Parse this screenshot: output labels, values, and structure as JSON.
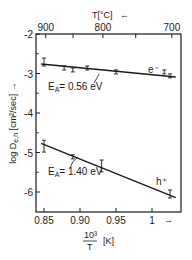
{
  "chart_data": {
    "type": "scatter",
    "title": "",
    "xlabel_numerator": "10³",
    "xlabel_denominator": "T",
    "xlabel_unit": "[K]",
    "xlabel_arrow": "→",
    "ylabel": "log D",
    "ylabel_sub": "e,h",
    "ylabel_unit": "[cm²/sec]",
    "ylabel_arrow": "→",
    "top_axis_label": "T[°C]",
    "top_axis_arrow": "←",
    "xlim": [
      0.84,
      1.04
    ],
    "ylim": [
      -6.5,
      -2
    ],
    "x_ticks": [
      0.85,
      0.9,
      0.95,
      1.0
    ],
    "x_tick_labels": [
      "0.85",
      "0.90",
      "0.95",
      "1"
    ],
    "y_ticks": [
      -2,
      -3,
      -4,
      -5,
      -6
    ],
    "y_tick_labels": [
      "-2",
      "-3",
      "-4",
      "-5",
      "-6"
    ],
    "top_ticks_celsius": [
      900,
      850,
      800,
      750,
      700
    ],
    "top_tick_labels": [
      "900",
      "",
      "800",
      "",
      "700"
    ],
    "grid": false,
    "series": [
      {
        "name": "e⁻",
        "label": "e⁻",
        "activation_energy": "E_A = 0.56 eV",
        "fit_line": [
          [
            0.846,
            -2.76
          ],
          [
            1.033,
            -3.09
          ]
        ],
        "points": [
          {
            "x": 0.85,
            "y": -2.71,
            "err": 0.1
          },
          {
            "x": 0.878,
            "y": -2.86,
            "err": 0.05
          },
          {
            "x": 0.89,
            "y": -2.91,
            "err": 0.03
          },
          {
            "x": 0.91,
            "y": -2.86,
            "err": 0.05
          },
          {
            "x": 0.95,
            "y": -2.96,
            "err": 0.05
          },
          {
            "x": 1.017,
            "y": -2.96,
            "err": 0.05
          },
          {
            "x": 1.025,
            "y": -3.06,
            "err": 0.03
          }
        ]
      },
      {
        "name": "h⁺",
        "label": "h⁺",
        "activation_energy": "E_A = 1.40 eV",
        "fit_line": [
          [
            0.846,
            -4.77
          ],
          [
            1.033,
            -6.14
          ]
        ],
        "points": [
          {
            "x": 0.85,
            "y": -4.84,
            "err": 0.15
          },
          {
            "x": 0.89,
            "y": -5.11,
            "err": 0.03
          },
          {
            "x": 0.93,
            "y": -5.34,
            "err": 0.15
          },
          {
            "x": 1.025,
            "y": -6.05,
            "err": 0.1
          }
        ]
      }
    ],
    "annotations": [
      {
        "text_main": "E",
        "text_sub": "A",
        "text_rest": "= 0.56 eV",
        "series": "e⁻"
      },
      {
        "text_main": "E",
        "text_sub": "A",
        "text_rest": "= 1.40 eV",
        "series": "h⁺"
      }
    ]
  }
}
